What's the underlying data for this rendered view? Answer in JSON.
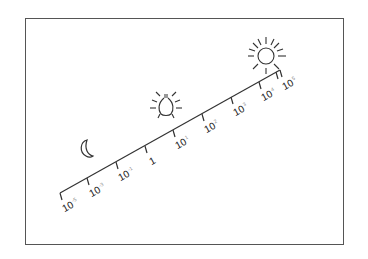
{
  "diagram": {
    "type": "logarithmic-illuminance-scale",
    "colors": {
      "line": "#333333",
      "frame": "#555555",
      "background": "#ffffff"
    },
    "icons": {
      "low": "moon-icon",
      "mid": "light-bulb-icon",
      "high": "sun-icon"
    },
    "ticks": [
      {
        "label": "10",
        "exp": "-5"
      },
      {
        "label": "10",
        "exp": "-3"
      },
      {
        "label": "10",
        "exp": "-1"
      },
      {
        "label": "1",
        "exp": ""
      },
      {
        "label": "10",
        "exp": "1"
      },
      {
        "label": "10",
        "exp": "2"
      },
      {
        "label": "10",
        "exp": "3"
      },
      {
        "label": "10",
        "exp": "4"
      },
      {
        "label": "10",
        "exp": "5"
      }
    ]
  }
}
